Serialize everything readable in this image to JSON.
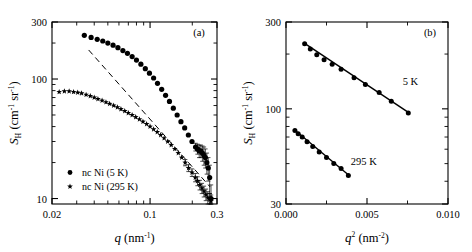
{
  "figure": {
    "background_color": "#ffffff",
    "ink_color": "#000000"
  },
  "panels": [
    {
      "id": "a",
      "label": "(a)",
      "xaxis": {
        "title_symbol": "q",
        "title_units": "(nm",
        "title_units_sup": "-1",
        "title_units_close": ")",
        "scale": "log",
        "lim": [
          0.02,
          0.3
        ],
        "ticks": [
          0.02,
          0.1,
          0.3
        ],
        "ticklabels": [
          "0.02",
          "0.1",
          "0.3"
        ]
      },
      "yaxis": {
        "title_symbol": "S",
        "title_sub": "H",
        "title_units_open": "(cm",
        "title_units_sup1": "-1",
        "title_units_mid": " sr",
        "title_units_sup2": "-1",
        "title_units_close": ")",
        "scale": "log",
        "lim": [
          9,
          300
        ],
        "ticks": [
          10,
          100,
          300
        ],
        "ticklabels": [
          "10",
          "100",
          "300"
        ]
      },
      "legend": [
        {
          "marker": "circle",
          "label": "nc Ni (5 K)"
        },
        {
          "marker": "star",
          "label": "nc Ni (295 K)"
        }
      ]
    },
    {
      "id": "b",
      "label": "(b)",
      "xaxis": {
        "title_symbol": "q",
        "title_sup": "2",
        "title_units": "(nm",
        "title_units_sup": "-2",
        "title_units_close": ")",
        "scale": "linear",
        "lim": [
          0.0,
          0.01
        ],
        "ticks": [
          0.0,
          0.005,
          0.01
        ],
        "ticklabels": [
          "0.000",
          "0.005",
          "0.010"
        ],
        "minor_ticks": [
          0.0025,
          0.0075
        ]
      },
      "yaxis": {
        "title_symbol": "S",
        "title_sub": "H",
        "title_units_open": "(cm",
        "title_units_sup1": "-1",
        "title_units_mid": " sr",
        "title_units_sup2": "-1",
        "title_units_close": ")",
        "scale": "log",
        "lim": [
          30,
          300
        ],
        "ticks": [
          30,
          100,
          300
        ],
        "ticklabels": [
          "30",
          "100",
          "300"
        ]
      },
      "annotations": [
        {
          "text": "5 K",
          "x": 0.0072,
          "y": 135
        },
        {
          "text": "295 K",
          "x": 0.004,
          "y": 49
        }
      ]
    }
  ],
  "chart_data": [
    {
      "type": "scatter",
      "panel": "a",
      "title": "",
      "xlabel": "q (nm^-1)",
      "ylabel": "S_H (cm^-1 sr^-1)",
      "xscale": "log",
      "yscale": "log",
      "xlim": [
        0.02,
        0.3
      ],
      "ylim": [
        9,
        300
      ],
      "grid": false,
      "legend_position": "lower-left",
      "series": [
        {
          "name": "nc Ni (5 K)",
          "marker": "circle",
          "x": [
            0.034,
            0.038,
            0.042,
            0.046,
            0.05,
            0.0545,
            0.059,
            0.064,
            0.069,
            0.0745,
            0.08,
            0.086,
            0.0925,
            0.099,
            0.106,
            0.113,
            0.121,
            0.129,
            0.1375,
            0.1465,
            0.156,
            0.166,
            0.1765,
            0.1875,
            0.199,
            0.211,
            0.218,
            0.224,
            0.23,
            0.236,
            0.242,
            0.248,
            0.254,
            0.26,
            0.266,
            0.272
          ],
          "y": [
            232,
            223,
            215,
            208,
            200,
            192,
            183,
            173,
            164,
            154,
            144,
            133,
            122,
            112,
            102,
            92,
            82,
            73,
            65,
            57,
            50,
            44,
            39,
            34,
            30,
            27,
            26,
            25,
            25,
            24,
            23,
            22,
            20,
            18,
            15,
            10
          ],
          "yerr": [
            0,
            0,
            0,
            0,
            0,
            0,
            0,
            0,
            0,
            0,
            0,
            0,
            0,
            0,
            0,
            0,
            0,
            0,
            0,
            0,
            0,
            0,
            0,
            0,
            0,
            2,
            2.5,
            3,
            3,
            3.5,
            4,
            4,
            4,
            4,
            4,
            3
          ]
        },
        {
          "name": "nc Ni (295 K)",
          "marker": "star",
          "x": [
            0.0225,
            0.0245,
            0.0265,
            0.0285,
            0.0305,
            0.0325,
            0.035,
            0.0375,
            0.04,
            0.0425,
            0.0455,
            0.0485,
            0.0515,
            0.055,
            0.0585,
            0.062,
            0.066,
            0.07,
            0.0745,
            0.079,
            0.084,
            0.089,
            0.0945,
            0.1,
            0.106,
            0.1125,
            0.119,
            0.126,
            0.1335,
            0.1415,
            0.15,
            0.159,
            0.168,
            0.178,
            0.188,
            0.199,
            0.21,
            0.218,
            0.226,
            0.234,
            0.242,
            0.25,
            0.258,
            0.266,
            0.272
          ],
          "y": [
            78,
            79,
            79,
            78,
            77,
            76,
            74,
            72,
            70,
            68,
            66,
            64,
            62,
            60,
            58,
            56,
            54,
            52,
            50,
            48,
            46,
            44,
            42,
            40,
            38,
            36,
            34,
            32,
            30,
            28,
            26,
            24,
            22,
            20,
            18,
            16.5,
            15,
            14,
            13,
            12.2,
            11.5,
            10.8,
            10.2,
            9.8,
            9.5
          ],
          "yerr": [
            0,
            0,
            0,
            0,
            0,
            0,
            0,
            0,
            0,
            0,
            0,
            0,
            0,
            0,
            0,
            0,
            0,
            0,
            0,
            0,
            0,
            0,
            0,
            0,
            0,
            0,
            0,
            0,
            0,
            0,
            0,
            0,
            0,
            1.2,
            1.2,
            1.2,
            1.2,
            1.2,
            1.2,
            1.2,
            1.2,
            1.2,
            1.2,
            1.2,
            1.2
          ]
        }
      ],
      "reference_lines": [
        {
          "name": "power-law-guide",
          "style": "dashed",
          "x": [
            0.0365,
            0.268
          ],
          "y": [
            175,
            12.5
          ]
        }
      ]
    },
    {
      "type": "scatter",
      "panel": "b",
      "title": "",
      "xlabel": "q^2 (nm^-2)",
      "ylabel": "S_H (cm^-1 sr^-1)",
      "xscale": "linear",
      "yscale": "log",
      "xlim": [
        0.0,
        0.01
      ],
      "ylim": [
        30,
        300
      ],
      "grid": false,
      "legend_position": "inline-annotations",
      "series": [
        {
          "name": "5 K",
          "marker": "circle",
          "fit": "linear-guinier",
          "x": [
            0.00115,
            0.0015,
            0.0019,
            0.00235,
            0.00285,
            0.0034,
            0.0042,
            0.0049,
            0.00575,
            0.0065,
            0.00755
          ],
          "y": [
            228,
            213,
            198,
            186,
            176,
            165,
            148,
            136,
            123,
            110,
            95
          ]
        },
        {
          "name": "295 K",
          "marker": "circle",
          "fit": "linear-guinier",
          "x": [
            0.00055,
            0.00075,
            0.001,
            0.0013,
            0.00165,
            0.00205,
            0.0025,
            0.00295,
            0.0034,
            0.00385
          ],
          "y": [
            76,
            73,
            70,
            66,
            62,
            58,
            54,
            50,
            47,
            43
          ]
        }
      ],
      "fit_lines": [
        {
          "name": "fit-5K",
          "style": "solid",
          "x": [
            0.00115,
            0.0076
          ],
          "y": [
            229,
            95
          ]
        },
        {
          "name": "fit-295K",
          "style": "solid",
          "x": [
            0.0005,
            0.0039
          ],
          "y": [
            77,
            43
          ]
        }
      ]
    }
  ]
}
